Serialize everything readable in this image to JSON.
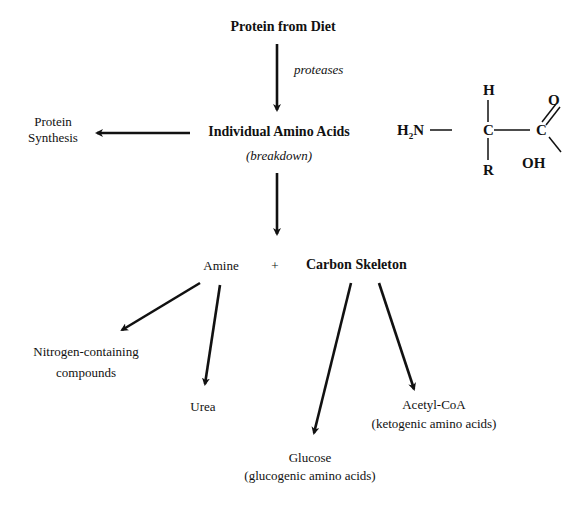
{
  "diagram": {
    "top": {
      "title": "Protein from Diet",
      "enzyme_label": "proteases"
    },
    "middle": {
      "title": "Individual Amino Acids",
      "subtitle": "(breakdown)"
    },
    "left_branch": {
      "line1": "Protein",
      "line2": "Synthesis"
    },
    "split": {
      "amine": "Amine",
      "plus": "+",
      "carbon": "Carbon Skeleton"
    },
    "amine_products": {
      "nitrogen_line1": "Nitrogen-containing",
      "nitrogen_line2": "compounds",
      "urea": "Urea"
    },
    "carbon_products": {
      "glucose": "Glucose",
      "glucose_note": "(glucogenic amino acids)",
      "acetyl": "Acetyl-CoA",
      "acetyl_note": "(ketogenic amino acids)"
    },
    "structure": {
      "h_top": "H",
      "amino_h": "H",
      "amino_sub": "2",
      "amino_n": "N",
      "alpha_c": "C",
      "carboxyl_c": "C",
      "oxygen": "O",
      "hydroxyl": "OH",
      "r_group": "R",
      "bond_single": "—"
    }
  }
}
